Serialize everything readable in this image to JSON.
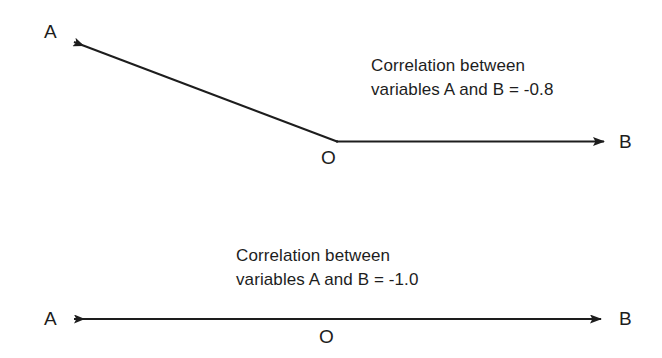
{
  "figure": {
    "background_color": "#ffffff",
    "ink_color": "#1d1d1d"
  },
  "diagrams": [
    {
      "id": "diagram-correlation-08",
      "description": "Two vectors from origin O forming an obtuse angle",
      "labels": {
        "a": "A",
        "b": "B",
        "origin": "O"
      },
      "caption": {
        "line1": "Correlation between",
        "line2": "variables A and B = -0.8"
      },
      "correlation_value": "-0.8"
    },
    {
      "id": "diagram-correlation-10",
      "description": "Two vectors from origin O pointing in exactly opposite directions along one line",
      "labels": {
        "a": "A",
        "b": "B",
        "origin": "O"
      },
      "caption": {
        "line1": "Correlation between",
        "line2": "variables A and B = -1.0"
      },
      "correlation_value": "-1.0"
    }
  ]
}
